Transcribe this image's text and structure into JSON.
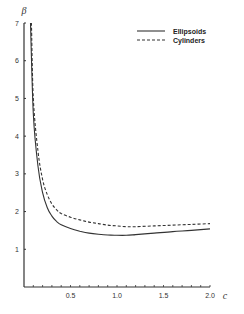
{
  "chart_data": {
    "type": "line",
    "title": "",
    "xlabel": "c",
    "ylabel": "β",
    "xlim": [
      0,
      2.0
    ],
    "ylim": [
      0,
      7
    ],
    "grid": false,
    "legend_position": "upper right",
    "x_ticks": [
      "0.5",
      "1.0",
      "1.5",
      "2.0"
    ],
    "y_ticks": [
      "1",
      "2",
      "3",
      "4",
      "5",
      "6",
      "7"
    ],
    "series": [
      {
        "name": "Ellipsoids",
        "style": "solid",
        "x": [
          0.07,
          0.1,
          0.15,
          0.2,
          0.25,
          0.3,
          0.35,
          0.4,
          0.5,
          0.6,
          0.7,
          0.8,
          0.9,
          1.0,
          1.1,
          1.2,
          1.4,
          1.6,
          1.8,
          2.0
        ],
        "y": [
          7.0,
          4.6,
          3.2,
          2.5,
          2.1,
          1.88,
          1.74,
          1.65,
          1.55,
          1.48,
          1.43,
          1.4,
          1.38,
          1.37,
          1.37,
          1.39,
          1.43,
          1.47,
          1.5,
          1.54
        ]
      },
      {
        "name": "Cylinders",
        "style": "dashed",
        "x": [
          0.08,
          0.1,
          0.15,
          0.2,
          0.25,
          0.3,
          0.35,
          0.4,
          0.5,
          0.6,
          0.7,
          0.8,
          0.9,
          1.0,
          1.1,
          1.2,
          1.4,
          1.6,
          1.8,
          2.0
        ],
        "y": [
          7.0,
          5.0,
          3.6,
          2.85,
          2.45,
          2.2,
          2.05,
          1.95,
          1.85,
          1.78,
          1.72,
          1.68,
          1.64,
          1.62,
          1.6,
          1.6,
          1.62,
          1.64,
          1.66,
          1.68
        ]
      }
    ]
  },
  "legend": {
    "items": [
      {
        "label": "Ellipsoids",
        "style": "solid"
      },
      {
        "label": "Cylinders",
        "style": "dashed"
      }
    ]
  },
  "axes": {
    "x_label": "c",
    "y_label": "β"
  }
}
